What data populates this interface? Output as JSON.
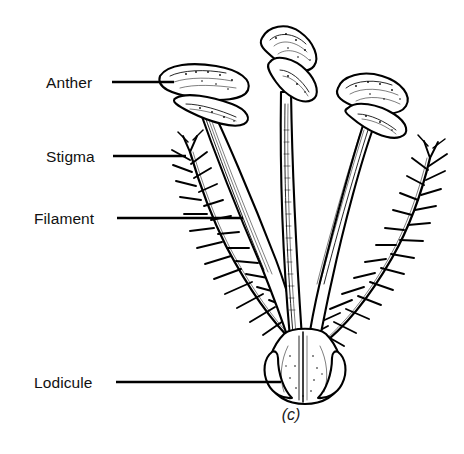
{
  "figure": {
    "caption": "(c)",
    "background_color": "#ffffff",
    "ink_color": "#000000"
  },
  "labels": [
    {
      "id": "anther",
      "text": "Anther",
      "text_x": 46,
      "text_y": 88,
      "leader_x1": 112,
      "leader_y1": 82,
      "leader_x2": 174,
      "leader_y2": 82
    },
    {
      "id": "stigma",
      "text": "Stigma",
      "text_x": 46,
      "text_y": 162,
      "leader_x1": 113,
      "leader_y1": 156,
      "leader_x2": 186,
      "leader_y2": 156
    },
    {
      "id": "filament",
      "text": "Filament",
      "text_x": 34,
      "text_y": 224,
      "leader_x1": 117,
      "leader_y1": 218,
      "leader_x2": 243,
      "leader_y2": 218
    },
    {
      "id": "lodicule",
      "text": "Lodicule",
      "text_x": 34,
      "text_y": 388,
      "leader_x1": 116,
      "leader_y1": 382,
      "leader_x2": 281,
      "leader_y2": 382
    }
  ],
  "caption_position": {
    "x": 291,
    "y": 420
  },
  "parts": {
    "anthers": [
      {
        "id": "anther-left",
        "orientation": "horizontal",
        "cx": 197,
        "cy": 88
      },
      {
        "id": "anther-center",
        "orientation": "diagonal",
        "cx": 288,
        "cy": 55
      },
      {
        "id": "anther-right",
        "orientation": "diagonal",
        "cx": 372,
        "cy": 103
      }
    ],
    "filaments": [
      {
        "id": "filament-left",
        "from": "lodicule",
        "to": "anther-left"
      },
      {
        "id": "filament-center",
        "from": "lodicule",
        "to": "anther-center"
      },
      {
        "id": "filament-right",
        "from": "lodicule",
        "to": "anther-right"
      }
    ],
    "stigmas": [
      {
        "id": "stigma-left",
        "type": "plumose",
        "direction": "upper-left"
      },
      {
        "id": "stigma-right",
        "type": "plumose",
        "direction": "upper-right"
      }
    ],
    "lodicule": {
      "id": "lodicule-body",
      "cx": 305,
      "cy": 370
    }
  }
}
